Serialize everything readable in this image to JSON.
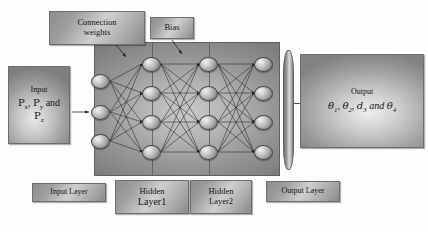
{
  "diagram": {
    "title_boxes": {
      "connection_weights": "Connection\nweights",
      "connection_weights_line1": "Connection",
      "connection_weights_line2": "weights",
      "bias": "Bias"
    },
    "input_box": {
      "caption": "Input",
      "variables": "Px, Py and Pz",
      "line1": "P",
      "line1_sub": "x",
      "line2": "P",
      "line2_sub": "y",
      "conjunction": "and",
      "line3": "P",
      "line3_sub": "z"
    },
    "output_box": {
      "caption": "Output",
      "variables": "θ1, θ2, d3 and θ4",
      "terms": [
        {
          "symbol": "θ",
          "sub": "1"
        },
        {
          "symbol": "θ",
          "sub": "2"
        },
        {
          "symbol": "d",
          "sub": "3"
        },
        {
          "symbol": "θ",
          "sub": "4"
        }
      ],
      "conjunction": "and"
    },
    "layer_labels": {
      "input": "Input Layer",
      "hidden1_line1": "Hidden",
      "hidden1_line2": "Layer1",
      "hidden2_line1": "Hidden",
      "hidden2_line2": "Layer2",
      "output": "Output Layer"
    },
    "network": {
      "layers": [
        {
          "name": "input-layer",
          "node_count": 3,
          "x": 100,
          "ys": [
            81,
            112,
            141
          ]
        },
        {
          "name": "hidden-layer-1",
          "node_count": 4,
          "x": 151,
          "ys": [
            64,
            93,
            122,
            152
          ]
        },
        {
          "name": "hidden-layer-2",
          "node_count": 4,
          "x": 208,
          "ys": [
            64,
            93,
            122,
            152
          ]
        },
        {
          "name": "output-layer",
          "node_count": 4,
          "x": 263,
          "ys": [
            64,
            93,
            122,
            152
          ]
        }
      ],
      "dividers_x": [
        151,
        208
      ]
    },
    "colors": {
      "page_background": "#fdfdfd",
      "panel_mid_grey": "#8a8a8a",
      "panel_light_grey": "#c9c9c9",
      "plaque_border": "#6e6e6e",
      "edge_stroke": "#232323",
      "neuron_highlight": "#f2f2f2"
    }
  }
}
